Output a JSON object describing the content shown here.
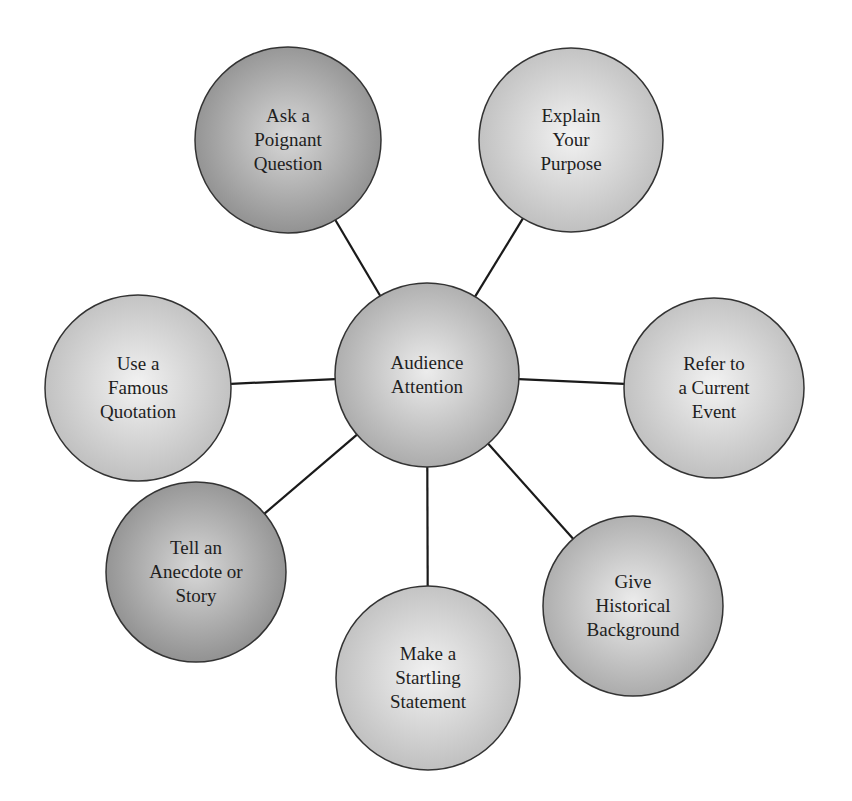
{
  "diagram": {
    "type": "hub-and-spoke",
    "center": {
      "id": "audience-attention",
      "lines": [
        "Audience",
        "Attention"
      ],
      "cx": 427,
      "cy": 375,
      "r": 92,
      "shade": "mid"
    },
    "nodes": [
      {
        "id": "ask-a-poignant-question",
        "lines": [
          "Ask a",
          "Poignant",
          "Question"
        ],
        "cx": 288,
        "cy": 140,
        "r": 93,
        "shade": "dark"
      },
      {
        "id": "explain-your-purpose",
        "lines": [
          "Explain",
          "Your",
          "Purpose"
        ],
        "cx": 571,
        "cy": 140,
        "r": 92,
        "shade": "light"
      },
      {
        "id": "use-a-famous-quotation",
        "lines": [
          "Use a",
          "Famous",
          "Quotation"
        ],
        "cx": 138,
        "cy": 388,
        "r": 93,
        "shade": "light"
      },
      {
        "id": "refer-to-a-current-event",
        "lines": [
          "Refer to",
          "a Current",
          "Event"
        ],
        "cx": 714,
        "cy": 388,
        "r": 90,
        "shade": "light"
      },
      {
        "id": "tell-an-anecdote-or-story",
        "lines": [
          "Tell an",
          "Anecdote or",
          "Story"
        ],
        "cx": 196,
        "cy": 572,
        "r": 90,
        "shade": "dark"
      },
      {
        "id": "make-a-startling-statement",
        "lines": [
          "Make a",
          "Startling",
          "Statement"
        ],
        "cx": 428,
        "cy": 678,
        "r": 92,
        "shade": "light"
      },
      {
        "id": "give-historical-background",
        "lines": [
          "Give",
          "Historical",
          "Background"
        ],
        "cx": 633,
        "cy": 606,
        "r": 90,
        "shade": "mid"
      }
    ],
    "colors": {
      "line": "#1a1a1a",
      "stroke": "#333333",
      "dark_center": "#d8d8d8",
      "dark_edge": "#8e8e8e",
      "mid_center": "#ececec",
      "mid_edge": "#a8a8a8",
      "light_center": "#f2f2f2",
      "light_edge": "#bdbdbd",
      "text": "#1e1e1e"
    }
  }
}
